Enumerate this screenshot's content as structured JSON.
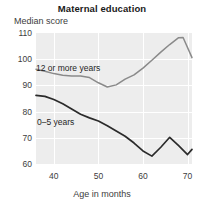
{
  "chart_data": {
    "type": "line",
    "title": "Maternal education",
    "xlabel": "Age in months",
    "ylabel": "Median score",
    "xlim": [
      36,
      71
    ],
    "ylim": [
      60,
      110
    ],
    "xticks": [
      40,
      50,
      60,
      70
    ],
    "yticks": [
      110,
      100,
      90,
      80,
      70,
      60
    ],
    "grid": true,
    "legend_position": "inline-annotations",
    "series": [
      {
        "name": "12 or more years",
        "color": "#8a8a8a",
        "x": [
          36,
          38,
          40,
          42,
          44,
          46,
          48,
          50,
          52,
          54,
          56,
          58,
          60,
          62,
          64,
          66,
          68,
          69,
          71
        ],
        "values": [
          96.2,
          95.4,
          94.5,
          93.9,
          93.6,
          93.6,
          93.0,
          91.0,
          89.4,
          90.2,
          92.4,
          94.0,
          96.6,
          99.6,
          102.7,
          105.6,
          108.2,
          108.3,
          100.6
        ]
      },
      {
        "name": "0–5 years",
        "color": "#2b2b2b",
        "x": [
          36,
          38,
          40,
          42,
          44,
          46,
          48,
          50,
          52,
          54,
          56,
          58,
          60,
          62,
          64,
          66,
          68,
          70,
          71
        ],
        "values": [
          86.2,
          85.8,
          84.6,
          83.0,
          81.0,
          79.0,
          77.6,
          76.4,
          74.6,
          72.6,
          70.6,
          68.0,
          65.0,
          63.0,
          66.4,
          70.2,
          67.0,
          63.6,
          65.6
        ]
      }
    ]
  }
}
